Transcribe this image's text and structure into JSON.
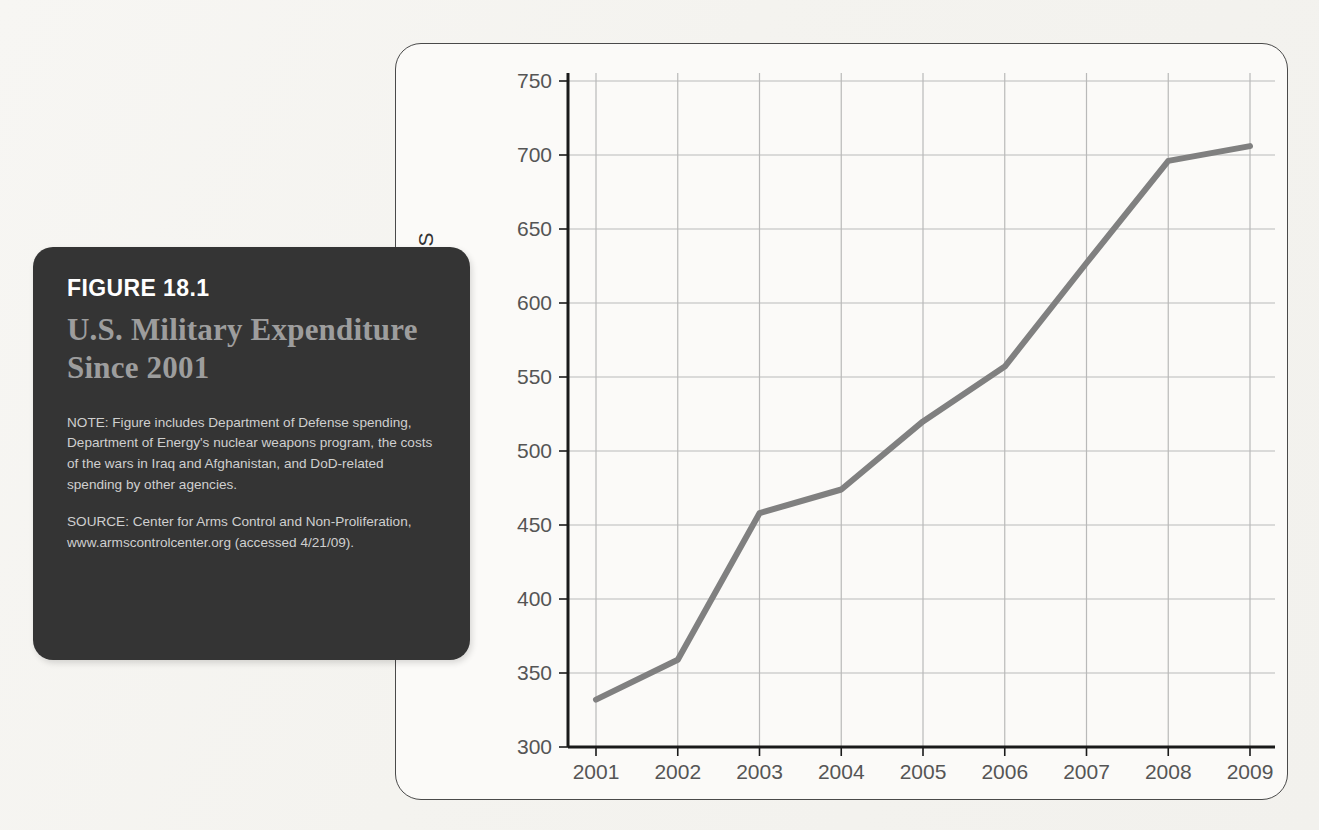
{
  "caption": {
    "figure_number": "FIGURE 18.1",
    "title": "U.S. Military Expenditure Since 2001",
    "note": "NOTE: Figure includes Department of Defense spending, Department of Energy's nuclear weapons program, the costs of the wars in Iraq and Afghanistan, and DoD-related spending by other agencies.",
    "source": "SOURCE: Center for Arms Control and Non-Proliferation, www.armscontrolcenter.org (accessed 4/21/09)."
  },
  "colors": {
    "card_background": "#343434",
    "figure_number_text": "#ffffff",
    "title_text": "#9d9d9d",
    "body_text": "#cfcfcf",
    "line_series": "#808080",
    "grid": "#b9b9b9",
    "axis": "#1a1a1a",
    "page_background": "#f6f5f2",
    "frame_border": "#4a4a4a"
  },
  "chart_data": {
    "type": "line",
    "title": "U.S. Military Expenditure Since 2001",
    "xlabel": "",
    "ylabel": "BILLIONS IN CONSTANT DOLLARS",
    "categories": [
      "2001",
      "2002",
      "2003",
      "2004",
      "2005",
      "2006",
      "2007",
      "2008",
      "2009"
    ],
    "x": [
      2001,
      2002,
      2003,
      2004,
      2005,
      2006,
      2007,
      2008,
      2009
    ],
    "values": [
      332,
      359,
      458,
      474,
      520,
      557,
      627,
      696,
      706
    ],
    "series": [
      {
        "name": "U.S. Military Expenditure",
        "values": [
          332,
          359,
          458,
          474,
          520,
          557,
          627,
          696,
          706
        ]
      }
    ],
    "ylim": [
      300,
      750
    ],
    "yticks": [
      300,
      350,
      400,
      450,
      500,
      550,
      600,
      650,
      700,
      750
    ],
    "ytick_labels": [
      "300",
      "350",
      "400",
      "450",
      "500",
      "550",
      "600",
      "650",
      "700",
      "750"
    ],
    "xtick_labels": [
      "2001",
      "2002",
      "2003",
      "2004",
      "2005",
      "2006",
      "2007",
      "2008",
      "2009"
    ],
    "grid": true,
    "legend": false,
    "markers": false,
    "line_width": 6
  }
}
